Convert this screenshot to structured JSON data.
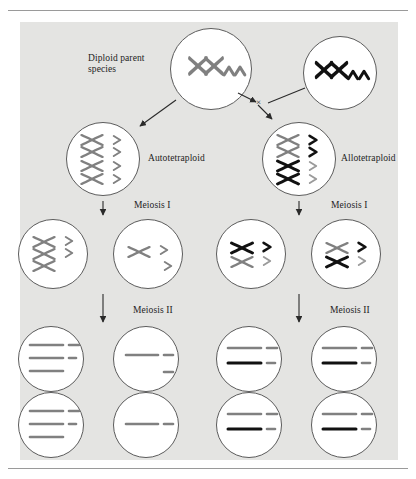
{
  "figure": {
    "kind": "biology-diagram",
    "background_color": "#e4e4e2",
    "page_color": "#ffffff",
    "cell_outline_color": "#5c5c5c",
    "chromosome_gray": "#808080",
    "chromosome_black": "#111111"
  },
  "labels": {
    "diploid_parent": "Diploid parent\nspecies",
    "autotetraploid": "Autotetraploid",
    "allotetraploid": "Allotetraploid",
    "meiosis_1_left": "Meiosis I",
    "meiosis_1_right": "Meiosis I",
    "meiosis_2_left": "Meiosis II",
    "meiosis_2_right": "Meiosis II",
    "cross_symbol": "×"
  },
  "cells": {
    "parent_left": {
      "name": "diploid-parent-left",
      "x_chromosomes": [
        {
          "color": "gray"
        },
        {
          "color": "gray"
        }
      ],
      "chevrons": [
        {
          "color": "gray"
        },
        {
          "color": "gray"
        }
      ]
    },
    "parent_right": {
      "name": "diploid-parent-right",
      "x_chromosomes": [
        {
          "color": "black"
        },
        {
          "color": "black"
        }
      ],
      "chevrons": [
        {
          "color": "black"
        },
        {
          "color": "black"
        }
      ]
    },
    "autotetraploid": {
      "name": "autotetraploid-cell",
      "x_chromosomes": [
        {
          "color": "gray"
        },
        {
          "color": "gray"
        },
        {
          "color": "gray"
        },
        {
          "color": "gray"
        }
      ],
      "chevrons": [
        {
          "color": "gray"
        },
        {
          "color": "gray"
        },
        {
          "color": "gray"
        },
        {
          "color": "gray"
        }
      ]
    },
    "allotetraploid": {
      "name": "allotetraploid-cell",
      "x_chromosomes": [
        {
          "color": "gray"
        },
        {
          "color": "gray"
        },
        {
          "color": "black"
        },
        {
          "color": "black"
        }
      ],
      "chevrons": [
        {
          "color": "black"
        },
        {
          "color": "black"
        },
        {
          "color": "gray"
        },
        {
          "color": "gray"
        }
      ]
    },
    "meiosis1_auto_left": {
      "name": "meiosis-one-auto-left",
      "x_chromosomes": [
        {
          "color": "gray"
        },
        {
          "color": "gray"
        },
        {
          "color": "gray"
        }
      ],
      "chevrons": [
        {
          "color": "gray"
        },
        {
          "color": "gray"
        }
      ]
    },
    "meiosis1_auto_right": {
      "name": "meiosis-one-auto-right",
      "x_chromosomes": [
        {
          "color": "gray"
        }
      ],
      "chevrons": [
        {
          "color": "gray"
        },
        {
          "color": "gray"
        }
      ]
    },
    "meiosis1_allo_left": {
      "name": "meiosis-one-allo-left",
      "x_chromosomes": [
        {
          "color": "black"
        },
        {
          "color": "gray"
        }
      ],
      "chevrons": [
        {
          "color": "black"
        },
        {
          "color": "gray"
        }
      ]
    },
    "meiosis1_allo_right": {
      "name": "meiosis-one-allo-right",
      "x_chromosomes": [
        {
          "color": "gray"
        },
        {
          "color": "black"
        }
      ],
      "chevrons": [
        {
          "color": "black"
        },
        {
          "color": "gray"
        }
      ]
    },
    "gamete_auto_1": {
      "name": "gamete-auto-upper-left",
      "bars": [
        {
          "color": "gray",
          "long": true
        },
        {
          "color": "gray",
          "long": true
        },
        {
          "color": "gray",
          "long": true
        }
      ],
      "short_bars": [
        {
          "color": "gray"
        },
        {
          "color": "gray"
        }
      ]
    },
    "gamete_auto_2": {
      "name": "gamete-auto-upper-right",
      "bars": [
        {
          "color": "gray",
          "long": true
        }
      ],
      "short_bars": [
        {
          "color": "gray"
        },
        {
          "color": "gray"
        }
      ]
    },
    "gamete_auto_3": {
      "name": "gamete-auto-lower-left",
      "bars": [
        {
          "color": "gray",
          "long": true
        },
        {
          "color": "gray",
          "long": true
        },
        {
          "color": "gray",
          "long": true
        }
      ],
      "short_bars": [
        {
          "color": "gray"
        },
        {
          "color": "gray"
        }
      ]
    },
    "gamete_auto_4": {
      "name": "gamete-auto-lower-right",
      "bars": [
        {
          "color": "gray",
          "long": true
        }
      ],
      "short_bars": [
        {
          "color": "gray"
        }
      ]
    },
    "gamete_allo_1": {
      "name": "gamete-allo-upper-left",
      "bars": [
        {
          "color": "gray",
          "long": true
        },
        {
          "color": "black",
          "long": true
        }
      ],
      "short_bars": [
        {
          "color": "gray"
        },
        {
          "color": "gray"
        }
      ]
    },
    "gamete_allo_2": {
      "name": "gamete-allo-upper-right",
      "bars": [
        {
          "color": "gray",
          "long": true
        },
        {
          "color": "black",
          "long": true
        }
      ],
      "short_bars": [
        {
          "color": "black"
        },
        {
          "color": "gray"
        }
      ]
    },
    "gamete_allo_3": {
      "name": "gamete-allo-lower-left",
      "bars": [
        {
          "color": "gray",
          "long": true
        },
        {
          "color": "black",
          "long": true
        }
      ],
      "short_bars": [
        {
          "color": "gray"
        },
        {
          "color": "gray"
        }
      ]
    },
    "gamete_allo_4": {
      "name": "gamete-allo-lower-right",
      "bars": [
        {
          "color": "gray",
          "long": true
        },
        {
          "color": "black",
          "long": true
        }
      ],
      "short_bars": [
        {
          "color": "gray"
        },
        {
          "color": "gray"
        }
      ]
    }
  },
  "arrows": {
    "parent_left_to_auto": "diagonal-down-left",
    "parent_left_to_cross": "diagonal-down-right",
    "parent_right_to_cross": "diagonal-down-left",
    "cross_to_allo": "diagonal-down-left",
    "auto_to_meiosis1": "down",
    "allo_to_meiosis1": "down",
    "auto_to_meiosis2": "down",
    "allo_to_meiosis2": "down"
  }
}
